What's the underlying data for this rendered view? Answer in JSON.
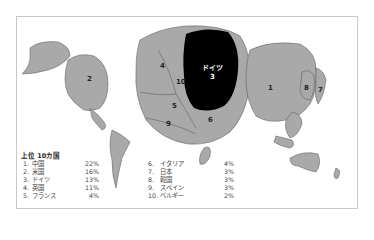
{
  "map": {
    "labels": [
      {
        "id": "1",
        "text": "1"
      },
      {
        "id": "2",
        "text": "2"
      },
      {
        "id": "3a",
        "text": "ドイツ"
      },
      {
        "id": "3b",
        "text": "3"
      },
      {
        "id": "4",
        "text": "4"
      },
      {
        "id": "5",
        "text": "5"
      },
      {
        "id": "6",
        "text": "6"
      },
      {
        "id": "7",
        "text": "7"
      },
      {
        "id": "8",
        "text": "8"
      },
      {
        "id": "9",
        "text": "9"
      },
      {
        "id": "10",
        "text": "10"
      }
    ],
    "colors": {
      "land": "#a9a9a9",
      "highlight": "#000000",
      "border": "#555555"
    }
  },
  "legend": {
    "title": "上位 10カ国",
    "items": [
      {
        "rank": "1.",
        "name": "中国",
        "value": "22%"
      },
      {
        "rank": "2.",
        "name": "米国",
        "value": "16%"
      },
      {
        "rank": "3.",
        "name": "ドイツ",
        "value": "13%"
      },
      {
        "rank": "4.",
        "name": "英国",
        "value": "11%"
      },
      {
        "rank": "5.",
        "name": "フランス",
        "value": "4%"
      },
      {
        "rank": "6.",
        "name": "イタリア",
        "value": "4%"
      },
      {
        "rank": "7.",
        "name": "日本",
        "value": "3%"
      },
      {
        "rank": "8.",
        "name": "韓国",
        "value": "3%"
      },
      {
        "rank": "9.",
        "name": "スペイン",
        "value": "3%"
      },
      {
        "rank": "10.",
        "name": "ベルギー",
        "value": "2%"
      }
    ]
  }
}
